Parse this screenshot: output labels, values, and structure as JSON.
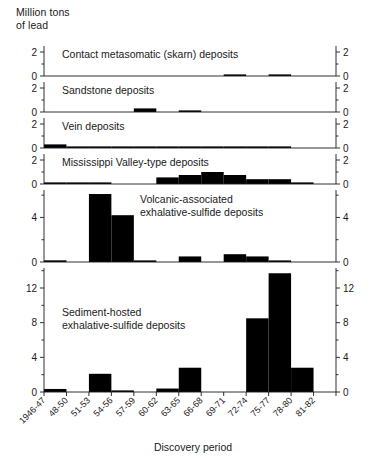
{
  "figure": {
    "unit_label_line1": "Million tons",
    "unit_label_line2": "of lead",
    "xlabel": "Discovery period"
  },
  "chart_data": {
    "type": "bar",
    "title": "",
    "subtitle": "",
    "xlabel": "Discovery period",
    "ylabel": "Million tons of lead",
    "grid": false,
    "legend": "none",
    "orientation": "vertical",
    "layout": "5 stacked panels sharing one category axis; duplicate mirrored y-axis on right side",
    "categories": [
      "1946-47",
      "48-50",
      "51-53",
      "54-56",
      "57-59",
      "60-62",
      "63-65",
      "66-68",
      "69-71",
      "72-74",
      "75-77",
      "78-80",
      "81-82"
    ],
    "panels": [
      {
        "name": "contact-metasomatic",
        "label": "Contact metasomatic (skarn) deposits",
        "ylim": [
          0,
          3
        ],
        "yticks": [
          0,
          2
        ],
        "ytick_labels": [
          "0",
          "2"
        ],
        "values": [
          0,
          0,
          0,
          0,
          0,
          0,
          0,
          0,
          0.12,
          0,
          0.1,
          0,
          0
        ]
      },
      {
        "name": "sandstone",
        "label": "Sandstone deposits",
        "ylim": [
          0,
          3
        ],
        "yticks": [
          0,
          2
        ],
        "ytick_labels": [
          "0",
          "2"
        ],
        "values": [
          0,
          0,
          0,
          0,
          0.3,
          0,
          0.08,
          0,
          0,
          0,
          0,
          0,
          0
        ]
      },
      {
        "name": "vein",
        "label": "Vein deposits",
        "ylim": [
          0,
          3
        ],
        "yticks": [
          0,
          2
        ],
        "ytick_labels": [
          "0",
          "2"
        ],
        "values": [
          0.3,
          0.03,
          0.03,
          0.03,
          0.03,
          0.03,
          0.05,
          0.05,
          0.12,
          0.12,
          0.12,
          0,
          0
        ]
      },
      {
        "name": "mississippi-valley-type",
        "label": "Mississippi Valley-type deposits",
        "ylim": [
          0,
          3
        ],
        "yticks": [
          0,
          2
        ],
        "ytick_labels": [
          "0",
          "2"
        ],
        "values": [
          0.04,
          0.12,
          0.12,
          0,
          0,
          0.55,
          0.75,
          1.0,
          0.75,
          0.4,
          0.4,
          0.08,
          0
        ]
      },
      {
        "name": "volcanic-associated",
        "label": "Volcanic-associated\nexhalative-sulfide deposits",
        "label_line1": "Volcanic-associated",
        "label_line2": "exhalative-sulfide deposits",
        "ylim": [
          0,
          7
        ],
        "yticks": [
          0,
          4
        ],
        "ytick_labels": [
          "0",
          "4"
        ],
        "values": [
          0.15,
          0,
          6.1,
          4.2,
          0.08,
          0,
          0.5,
          0,
          0.7,
          0.5,
          0.12,
          0,
          0
        ]
      },
      {
        "name": "sediment-hosted",
        "label": "Sediment-hosted\nexhalative-sulfide deposits",
        "label_line1": "Sediment-hosted",
        "label_line2": "exhalative-sulfide deposits",
        "ylim": [
          0,
          15
        ],
        "yticks": [
          0,
          4,
          8,
          12
        ],
        "ytick_labels": [
          "0",
          "4",
          "8",
          "12"
        ],
        "values": [
          0.35,
          0,
          2.1,
          0.08,
          0,
          0.4,
          2.8,
          0,
          0,
          8.5,
          13.7,
          2.8,
          0
        ]
      }
    ]
  }
}
